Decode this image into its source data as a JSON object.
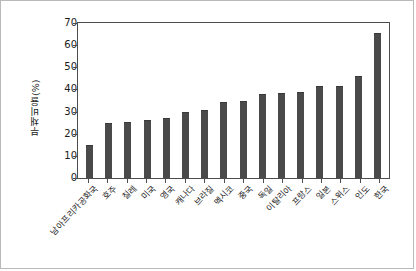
{
  "chart_data": {
    "type": "bar",
    "title": "",
    "xlabel": "",
    "ylabel": "부채비율(%)",
    "ylim": [
      0,
      70
    ],
    "ytick_labels": [
      "0",
      "10",
      "20",
      "30",
      "40",
      "50",
      "60",
      "70"
    ],
    "ytick_values": [
      0,
      10,
      20,
      30,
      40,
      50,
      60,
      70
    ],
    "grid": false,
    "legend": null,
    "bar_color": "#4a4a4a",
    "categories": [
      "남아프리카공화국",
      "호주",
      "칠레",
      "미국",
      "영국",
      "캐나다",
      "브라질",
      "멕시코",
      "중국",
      "독일",
      "이탈리아",
      "프랑스",
      "일본",
      "스위스",
      "인도",
      "한국"
    ],
    "values": [
      15,
      25,
      25.5,
      26,
      27,
      30,
      30.5,
      34.5,
      35,
      38,
      38.5,
      39,
      41.5,
      41.5,
      46,
      65.5
    ]
  }
}
